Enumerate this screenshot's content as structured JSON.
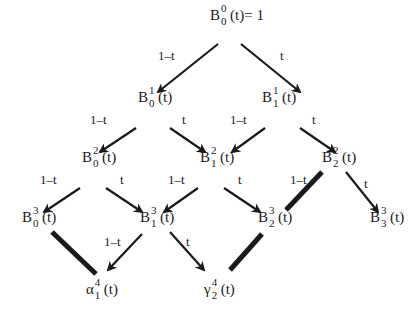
{
  "diagram": {
    "nodes": [
      {
        "id": "B00",
        "base": "B",
        "sup": "0",
        "sub": "0",
        "arg": "(t)",
        "suffix": "= 1",
        "x": 210,
        "y": 6
      },
      {
        "id": "B10",
        "base": "B",
        "sup": "1",
        "sub": "0",
        "arg": "(t)",
        "suffix": "",
        "x": 138,
        "y": 88
      },
      {
        "id": "B11",
        "base": "B",
        "sup": "1",
        "sub": "1",
        "arg": "(t)",
        "suffix": "",
        "x": 262,
        "y": 88
      },
      {
        "id": "B20",
        "base": "B",
        "sup": "2",
        "sub": "0",
        "arg": "(t)",
        "suffix": "",
        "x": 82,
        "y": 148
      },
      {
        "id": "B21",
        "base": "B",
        "sup": "2",
        "sub": "1",
        "arg": "(t)",
        "suffix": "",
        "x": 200,
        "y": 148
      },
      {
        "id": "B22",
        "base": "B",
        "sup": "2",
        "sub": "2",
        "arg": "(t)",
        "suffix": "",
        "x": 322,
        "y": 148
      },
      {
        "id": "B30",
        "base": "B",
        "sup": "3",
        "sub": "0",
        "arg": "(t)",
        "suffix": "",
        "x": 22,
        "y": 208
      },
      {
        "id": "B31",
        "base": "B",
        "sup": "3",
        "sub": "1",
        "arg": "(t)",
        "suffix": "",
        "x": 140,
        "y": 208
      },
      {
        "id": "B32",
        "base": "B",
        "sup": "3",
        "sub": "2",
        "arg": "(t)",
        "suffix": "",
        "x": 258,
        "y": 208
      },
      {
        "id": "B33",
        "base": "B",
        "sup": "3",
        "sub": "3",
        "arg": "(t)",
        "suffix": "",
        "x": 370,
        "y": 208
      },
      {
        "id": "alpha41",
        "base": "α",
        "sup": "4",
        "sub": "1",
        "arg": "(t)",
        "suffix": "",
        "x": 86,
        "y": 280
      },
      {
        "id": "gamma42",
        "base": "γ",
        "sup": "4",
        "sub": "2",
        "arg": "(t)",
        "suffix": "",
        "x": 204,
        "y": 280
      }
    ],
    "edges": [
      {
        "from": "B00",
        "to": "B10",
        "label": "1–t",
        "x1": 218,
        "y1": 44,
        "x2": 158,
        "y2": 92,
        "lx": 158,
        "ly": 48,
        "thick": false,
        "arrow": true
      },
      {
        "from": "B00",
        "to": "B11",
        "label": "t",
        "x1": 241,
        "y1": 44,
        "x2": 300,
        "y2": 92,
        "lx": 280,
        "ly": 48,
        "thick": false,
        "arrow": true
      },
      {
        "from": "B10",
        "to": "B20",
        "label": "1–t",
        "x1": 136,
        "y1": 128,
        "x2": 100,
        "y2": 152,
        "lx": 90,
        "ly": 112,
        "thick": false,
        "arrow": true
      },
      {
        "from": "B10",
        "to": "B21",
        "label": "t",
        "x1": 170,
        "y1": 128,
        "x2": 205,
        "y2": 152,
        "lx": 182,
        "ly": 112,
        "thick": false,
        "arrow": true
      },
      {
        "from": "B11",
        "to": "B21",
        "label": "1–t",
        "x1": 265,
        "y1": 128,
        "x2": 232,
        "y2": 152,
        "lx": 230,
        "ly": 112,
        "thick": false,
        "arrow": true
      },
      {
        "from": "B11",
        "to": "B22",
        "label": "t",
        "x1": 300,
        "y1": 128,
        "x2": 335,
        "y2": 152,
        "lx": 312,
        "ly": 112,
        "thick": false,
        "arrow": true
      },
      {
        "from": "B20",
        "to": "B30",
        "label": "1–t",
        "x1": 80,
        "y1": 188,
        "x2": 44,
        "y2": 212,
        "lx": 40,
        "ly": 172,
        "thick": false,
        "arrow": true
      },
      {
        "from": "B20",
        "to": "B31",
        "label": "t",
        "x1": 106,
        "y1": 188,
        "x2": 142,
        "y2": 212,
        "lx": 120,
        "ly": 172,
        "thick": false,
        "arrow": true
      },
      {
        "from": "B21",
        "to": "B31",
        "label": "1–t",
        "x1": 198,
        "y1": 188,
        "x2": 164,
        "y2": 212,
        "lx": 168,
        "ly": 172,
        "thick": false,
        "arrow": true
      },
      {
        "from": "B21",
        "to": "B32",
        "label": "t",
        "x1": 224,
        "y1": 188,
        "x2": 260,
        "y2": 212,
        "lx": 238,
        "ly": 172,
        "thick": false,
        "arrow": true
      },
      {
        "from": "B22",
        "to": "B32",
        "label": "1–t",
        "x1": 322,
        "y1": 172,
        "x2": 286,
        "y2": 210,
        "lx": 290,
        "ly": 172,
        "thick": true,
        "arrow": false
      },
      {
        "from": "B22",
        "to": "B33",
        "label": "t",
        "x1": 346,
        "y1": 172,
        "x2": 378,
        "y2": 212,
        "lx": 364,
        "ly": 176,
        "thick": false,
        "arrow": true
      },
      {
        "from": "B30",
        "to": "alpha41",
        "label": "",
        "x1": 52,
        "y1": 232,
        "x2": 96,
        "y2": 274,
        "lx": 0,
        "ly": 0,
        "thick": true,
        "arrow": false
      },
      {
        "from": "B31",
        "to": "alpha41",
        "label": "1–t",
        "x1": 142,
        "y1": 234,
        "x2": 108,
        "y2": 270,
        "lx": 104,
        "ly": 234,
        "thick": false,
        "arrow": true
      },
      {
        "from": "B31",
        "to": "gamma42",
        "label": "t",
        "x1": 170,
        "y1": 232,
        "x2": 204,
        "y2": 270,
        "lx": 186,
        "ly": 234,
        "thick": false,
        "arrow": true
      },
      {
        "from": "B32",
        "to": "gamma42",
        "label": "",
        "x1": 262,
        "y1": 234,
        "x2": 230,
        "y2": 270,
        "lx": 0,
        "ly": 0,
        "thick": true,
        "arrow": false
      }
    ]
  }
}
